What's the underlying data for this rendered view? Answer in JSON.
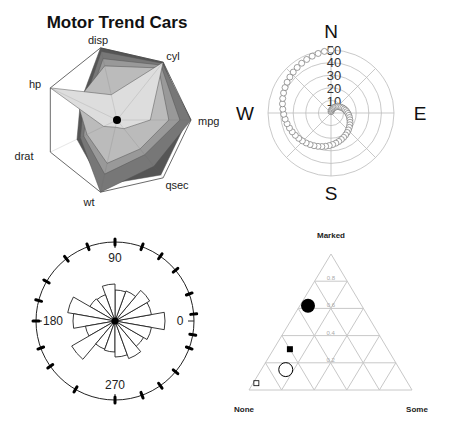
{
  "chart_data": [
    {
      "type": "radar",
      "title": "Motor Trend Cars",
      "axes": [
        "mpg",
        "cyl",
        "disp",
        "hp",
        "drat",
        "wt",
        "qsec"
      ],
      "axis_angles_deg": [
        0,
        51.43,
        102.86,
        154.29,
        205.71,
        257.14,
        308.57
      ],
      "series": [
        {
          "name": "series-1",
          "fill": "#555555",
          "values": [
            0.95,
            1.0,
            1.0,
            0.55,
            0.6,
            0.9,
            0.95
          ]
        },
        {
          "name": "series-2",
          "fill": "#777777",
          "values": [
            1.0,
            0.98,
            0.95,
            0.5,
            0.55,
            1.0,
            0.8
          ]
        },
        {
          "name": "series-3",
          "fill": "#999999",
          "values": [
            0.85,
            0.95,
            0.85,
            0.45,
            0.5,
            0.75,
            0.6
          ]
        },
        {
          "name": "series-4",
          "fill": "#bbbbbb",
          "values": [
            0.7,
            0.9,
            0.75,
            0.6,
            0.45,
            0.6,
            0.5
          ]
        },
        {
          "name": "series-5",
          "fill": "#dddddd",
          "values": [
            0.45,
            1.0,
            0.35,
            1.0,
            0.2,
            0.1,
            0.15
          ]
        }
      ],
      "grid": "heptagon"
    },
    {
      "type": "scatter",
      "subtype": "polar",
      "ring_labels": [
        "10",
        "20",
        "30",
        "40",
        "50"
      ],
      "rlim": [
        0,
        50
      ],
      "compass_labels": {
        "n": "N",
        "e": "E",
        "s": "S",
        "w": "W"
      },
      "series": [
        {
          "name": "spiral",
          "marker": "open-circle",
          "r_start": 1,
          "r_end": 50,
          "theta_start_deg": 90,
          "turns": 1.0,
          "n_points": 60
        }
      ]
    },
    {
      "type": "bar",
      "subtype": "rose",
      "angle_labels": [
        "0",
        "90",
        "180",
        "270"
      ],
      "sector_width_deg": 20,
      "sector_centers_deg": [
        0,
        20,
        40,
        60,
        80,
        100,
        120,
        140,
        160,
        180,
        200,
        220,
        240,
        260,
        280,
        300,
        320,
        340
      ],
      "values": [
        50,
        37,
        40,
        32,
        31,
        37,
        28,
        29,
        48,
        42,
        30,
        50,
        30,
        31,
        36,
        40,
        33,
        37
      ],
      "rug_angles_deg": [
        5,
        20,
        40,
        55,
        70,
        90,
        110,
        128,
        150,
        165,
        180,
        200,
        215,
        240,
        270,
        290,
        305,
        320,
        340,
        350
      ]
    },
    {
      "type": "scatter",
      "subtype": "ternary",
      "corner_labels": {
        "top": "Marked",
        "left": "None",
        "right": "Some"
      },
      "grid_ticks": [
        "0.2",
        "0.4",
        "0.6",
        "0.8"
      ],
      "points": [
        {
          "marked": 0.62,
          "none": 0.33,
          "some": 0.05,
          "marker": "filled-circle",
          "size": 7
        },
        {
          "marked": 0.3,
          "none": 0.6,
          "some": 0.1,
          "marker": "filled-square",
          "size": 3
        },
        {
          "marked": 0.15,
          "none": 0.7,
          "some": 0.15,
          "marker": "open-circle",
          "size": 7
        },
        {
          "marked": 0.05,
          "none": 0.93,
          "some": 0.02,
          "marker": "open-square",
          "size": 2.5
        }
      ]
    }
  ],
  "radar": {
    "title": "Motor Trend Cars",
    "labels": {
      "disp": "disp",
      "cyl": "cyl",
      "mpg": "mpg",
      "qsec": "qsec",
      "wt": "wt",
      "drat": "drat",
      "hp": "hp"
    }
  },
  "polar": {
    "n": "N",
    "e": "E",
    "s": "S",
    "w": "W",
    "rings": [
      "10",
      "20",
      "30",
      "40",
      "50"
    ]
  },
  "rose": {
    "l0": "0",
    "l90": "90",
    "l180": "180",
    "l270": "270"
  },
  "ternary": {
    "top": "Marked",
    "left": "None",
    "right": "Some"
  }
}
